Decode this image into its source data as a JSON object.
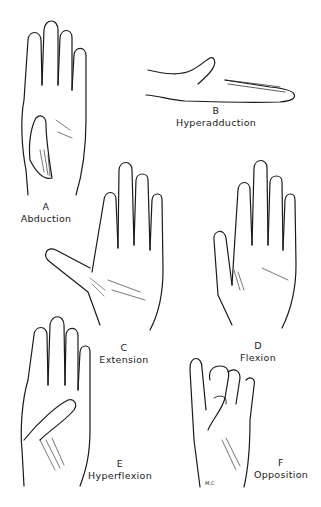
{
  "figure": {
    "panels": [
      {
        "id": "A",
        "letter": "A",
        "name": "Abduction"
      },
      {
        "id": "B",
        "letter": "B",
        "name": "Hyperadduction"
      },
      {
        "id": "C",
        "letter": "C",
        "name": "Extension"
      },
      {
        "id": "D",
        "letter": "D",
        "name": "Flexion"
      },
      {
        "id": "E",
        "letter": "E",
        "name": "Hyperflexion"
      },
      {
        "id": "F",
        "letter": "F",
        "name": "Opposition"
      }
    ],
    "signature": "M.C.",
    "line_color": "#1a1a1a",
    "background": "#ffffff"
  }
}
